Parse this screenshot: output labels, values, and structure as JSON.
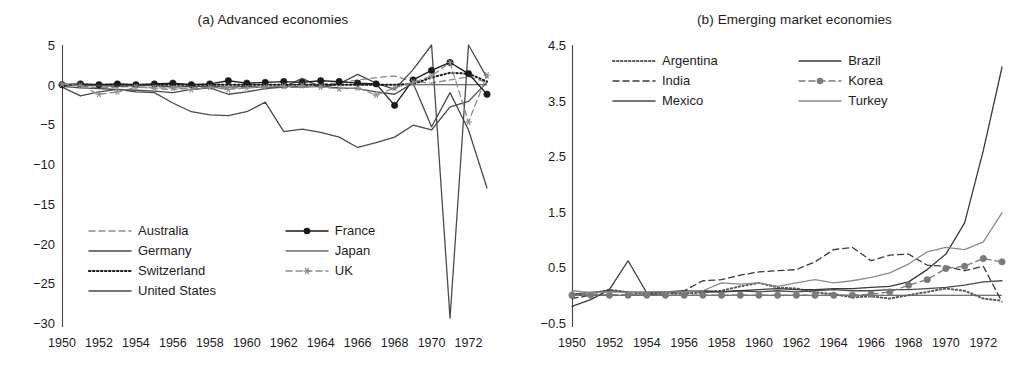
{
  "figure": {
    "panels": [
      {
        "key": "a",
        "title": "(a) Advanced economies",
        "chart_data": {
          "type": "line",
          "title": "(a) Advanced economies",
          "xlabel": "",
          "ylabel": "",
          "grid": false,
          "legend_position": "inside-lower-left",
          "xlim": [
            1950,
            1973
          ],
          "ylim": [
            -30,
            5
          ],
          "yticks": [
            5,
            0,
            -5,
            -10,
            -15,
            -20,
            -25,
            -30
          ],
          "ytick_labels": [
            "5",
            "0",
            "−5",
            "−10",
            "−15",
            "−20",
            "−25",
            "−30"
          ],
          "xticks": [
            1950,
            1952,
            1954,
            1956,
            1958,
            1960,
            1962,
            1964,
            1966,
            1968,
            1970,
            1972
          ],
          "xtick_labels": [
            "1950",
            "1952",
            "1954",
            "1956",
            "1958",
            "1960",
            "1962",
            "1964",
            "1966",
            "1968",
            "1970",
            "1972"
          ],
          "x": [
            1950,
            1951,
            1952,
            1953,
            1954,
            1955,
            1956,
            1957,
            1958,
            1959,
            1960,
            1961,
            1962,
            1963,
            1964,
            1965,
            1966,
            1967,
            1968,
            1969,
            1970,
            1971,
            1972,
            1973
          ],
          "series": [
            {
              "name": "Australia",
              "style": "dashed",
              "color": "#8c8c8c",
              "marker": "none",
              "values": [
                0.1,
                -0.2,
                -0.4,
                -0.3,
                -0.2,
                -0.5,
                -0.6,
                -0.4,
                -0.3,
                -0.5,
                -0.3,
                -0.2,
                -0.4,
                -0.2,
                0.1,
                0.2,
                0.6,
                0.9,
                1.1,
                0.4,
                0.2,
                0.6,
                1.0,
                0.3
              ]
            },
            {
              "name": "Germany",
              "style": "solid",
              "color": "#4a4a4a",
              "marker": "none",
              "values": [
                -0.3,
                -1.4,
                -0.9,
                -0.6,
                -0.7,
                -0.8,
                -1.0,
                -0.6,
                -0.4,
                -1.2,
                -0.9,
                -0.5,
                -0.3,
                0.8,
                -0.3,
                0.1,
                1.3,
                0.2,
                -0.6,
                1.9,
                5.0,
                -29.4,
                5.0,
                0.9
              ]
            },
            {
              "name": "Switzerland",
              "style": "dotted",
              "color": "#1a1a1a",
              "marker": "none",
              "values": [
                0.0,
                0.0,
                0.0,
                0.0,
                0.0,
                0.0,
                0.0,
                0.0,
                0.0,
                0.0,
                0.0,
                0.0,
                0.0,
                0.0,
                0.0,
                0.0,
                0.0,
                0.0,
                0.0,
                0.1,
                0.9,
                1.5,
                1.4,
                0.4
              ]
            },
            {
              "name": "United States",
              "style": "solid",
              "color": "#4a4a4a",
              "marker": "none",
              "values": [
                -0.2,
                -0.4,
                -0.5,
                -0.6,
                -0.9,
                -1.0,
                -2.3,
                -3.4,
                -3.8,
                -3.9,
                -3.4,
                -2.2,
                -5.9,
                -5.6,
                -6.0,
                -6.6,
                -7.9,
                -7.3,
                -6.6,
                -5.1,
                -5.7,
                -2.8,
                -2.1,
                0.3
              ]
            },
            {
              "name": "France",
              "style": "solid-marker",
              "color": "#1a1a1a",
              "marker": "circle-filled",
              "values": [
                0.0,
                0.1,
                0.0,
                0.1,
                0.0,
                0.1,
                0.2,
                0.0,
                0.1,
                0.5,
                0.2,
                0.3,
                0.4,
                0.3,
                0.5,
                0.4,
                0.2,
                0.1,
                -2.6,
                0.6,
                1.8,
                2.8,
                1.4,
                -1.2
              ]
            },
            {
              "name": "Japan",
              "style": "solid",
              "color": "#4a4a4a",
              "marker": "none",
              "values": [
                0.0,
                -0.1,
                -0.1,
                -0.2,
                -0.1,
                -0.1,
                -0.3,
                -0.2,
                -0.2,
                -0.3,
                -0.2,
                -0.4,
                -0.2,
                -0.3,
                -0.2,
                -0.4,
                -0.5,
                -0.9,
                -1.2,
                0.2,
                -5.3,
                -1.0,
                -5.7,
                -13.0
              ]
            },
            {
              "name": "UK",
              "style": "dashed-marker",
              "color": "#8c8c8c",
              "marker": "star",
              "values": [
                0.1,
                -0.1,
                -1.2,
                -0.9,
                -0.3,
                -0.4,
                -0.4,
                -0.6,
                -0.3,
                -0.6,
                -0.4,
                -0.3,
                -0.2,
                -0.1,
                -0.3,
                -0.5,
                -0.4,
                -1.3,
                -0.4,
                0.3,
                1.1,
                2.8,
                -4.7,
                1.2
              ]
            }
          ],
          "legend": [
            {
              "label": "Australia",
              "style": "dashed",
              "color": "#8c8c8c",
              "marker": "none"
            },
            {
              "label": "France",
              "style": "solid-marker",
              "color": "#1a1a1a",
              "marker": "circle-filled"
            },
            {
              "label": "Germany",
              "style": "solid",
              "color": "#4a4a4a",
              "marker": "none"
            },
            {
              "label": "Japan",
              "style": "solid",
              "color": "#6a6a6a",
              "marker": "none"
            },
            {
              "label": "Switzerland",
              "style": "dotted",
              "color": "#1a1a1a",
              "marker": "none"
            },
            {
              "label": "UK",
              "style": "dashed-marker",
              "color": "#8c8c8c",
              "marker": "star"
            },
            {
              "label": "United States",
              "style": "solid",
              "color": "#4a4a4a",
              "marker": "none"
            }
          ]
        }
      },
      {
        "key": "b",
        "title": "(b) Emerging market economies",
        "chart_data": {
          "type": "line",
          "title": "(b) Emerging market economies",
          "xlabel": "",
          "ylabel": "",
          "grid": false,
          "legend_position": "inside-upper-left",
          "xlim": [
            1950,
            1973
          ],
          "ylim": [
            -0.5,
            4.5
          ],
          "yticks": [
            4.5,
            3.5,
            2.5,
            1.5,
            0.5,
            -0.5
          ],
          "ytick_labels": [
            "4.5",
            "3.5",
            "2.5",
            "1.5",
            "0.5",
            "−0.5"
          ],
          "xticks": [
            1950,
            1952,
            1954,
            1956,
            1958,
            1960,
            1962,
            1964,
            1966,
            1968,
            1970,
            1972
          ],
          "xtick_labels": [
            "1950",
            "1952",
            "1954",
            "1956",
            "1958",
            "1960",
            "1962",
            "1964",
            "1966",
            "1968",
            "1970",
            "1972"
          ],
          "x": [
            1950,
            1951,
            1952,
            1953,
            1954,
            1955,
            1956,
            1957,
            1958,
            1959,
            1960,
            1961,
            1962,
            1963,
            1964,
            1965,
            1966,
            1967,
            1968,
            1969,
            1970,
            1971,
            1972,
            1973
          ],
          "series": [
            {
              "name": "Argentina",
              "style": "dotted",
              "color": "#5a5a5a",
              "marker": "none",
              "values": [
                0.0,
                0.02,
                0.1,
                0.05,
                0.02,
                0.03,
                0.03,
                0.05,
                0.08,
                0.16,
                0.22,
                0.14,
                0.12,
                0.05,
                0.02,
                -0.04,
                -0.02,
                -0.06,
                0.0,
                0.06,
                0.12,
                0.08,
                -0.06,
                -0.1
              ]
            },
            {
              "name": "India",
              "style": "dashed",
              "color": "#3a3a3a",
              "marker": "none",
              "values": [
                -0.06,
                0.0,
                0.0,
                0.0,
                0.0,
                0.02,
                0.08,
                0.26,
                0.28,
                0.36,
                0.42,
                0.44,
                0.46,
                0.6,
                0.82,
                0.86,
                0.62,
                0.72,
                0.74,
                0.54,
                0.52,
                0.44,
                0.52,
                -0.12
              ]
            },
            {
              "name": "Mexico",
              "style": "solid",
              "color": "#4a4a4a",
              "marker": "none",
              "values": [
                0.02,
                0.05,
                0.08,
                0.06,
                0.05,
                0.06,
                0.08,
                0.06,
                0.06,
                0.08,
                0.06,
                0.08,
                0.06,
                0.08,
                0.1,
                0.08,
                0.08,
                0.1,
                0.1,
                0.12,
                0.14,
                0.18,
                0.24,
                0.26
              ]
            },
            {
              "name": "Brazil",
              "style": "solid",
              "color": "#3a3a3a",
              "marker": "none",
              "values": [
                -0.2,
                -0.08,
                0.1,
                0.62,
                0.04,
                0.06,
                0.06,
                0.08,
                0.06,
                0.08,
                0.1,
                0.12,
                0.1,
                0.1,
                0.12,
                0.12,
                0.14,
                0.16,
                0.24,
                0.46,
                0.74,
                1.3,
                2.6,
                4.1
              ]
            },
            {
              "name": "Korea",
              "style": "dashed-marker",
              "color": "#7a7a7a",
              "marker": "circle-filled",
              "values": [
                0.0,
                0.0,
                0.0,
                0.0,
                0.0,
                0.0,
                0.0,
                0.0,
                0.0,
                0.0,
                0.0,
                0.0,
                0.0,
                0.0,
                0.0,
                0.0,
                0.02,
                0.06,
                0.18,
                0.28,
                0.48,
                0.52,
                0.66,
                0.6
              ]
            },
            {
              "name": "Turkey",
              "style": "solid",
              "color": "#8a8a8a",
              "marker": "none",
              "values": [
                0.08,
                0.05,
                0.06,
                0.05,
                0.06,
                0.06,
                0.06,
                0.08,
                0.22,
                0.2,
                0.22,
                0.16,
                0.22,
                0.28,
                0.22,
                0.26,
                0.32,
                0.4,
                0.56,
                0.78,
                0.86,
                0.82,
                0.96,
                1.48
              ]
            }
          ],
          "legend": [
            {
              "label": "Argentina",
              "style": "dotted",
              "color": "#5a5a5a",
              "marker": "none"
            },
            {
              "label": "Brazil",
              "style": "solid",
              "color": "#3a3a3a",
              "marker": "none"
            },
            {
              "label": "India",
              "style": "dashed",
              "color": "#3a3a3a",
              "marker": "none"
            },
            {
              "label": "Korea",
              "style": "dashed-marker",
              "color": "#7a7a7a",
              "marker": "circle-filled"
            },
            {
              "label": "Mexico",
              "style": "solid",
              "color": "#4a4a4a",
              "marker": "none"
            },
            {
              "label": "Turkey",
              "style": "solid",
              "color": "#8a8a8a",
              "marker": "none"
            }
          ]
        }
      }
    ]
  }
}
